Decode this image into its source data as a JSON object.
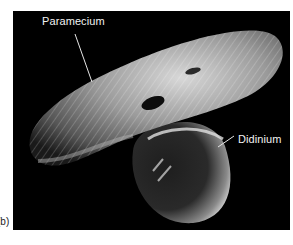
{
  "figure": {
    "panel_label": "(b)",
    "image_description": "Scanning electron micrograph of a Didinium attacking a Paramecium",
    "labels": [
      {
        "text": "Paramecium"
      },
      {
        "text": "Didinium"
      }
    ],
    "colors": {
      "background": "#000000",
      "label_text": "#f2f2f2",
      "page": "#ffffff"
    }
  }
}
